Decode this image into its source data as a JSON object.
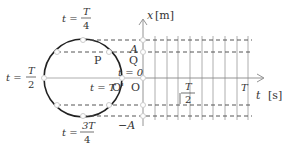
{
  "diagram": {
    "type": "circular-motion-to-simple-harmonic-oscillation",
    "colors": {
      "circle": "#222222",
      "axis": "#888888",
      "dashed": "#555555",
      "grid": "#999999",
      "marker_fill": "#ffffff",
      "marker_stroke": "#cccccc",
      "text": "#333333"
    },
    "axis_labels": {
      "x_axis": "x",
      "x_unit": "[m]",
      "t_axis": "t",
      "t_unit": "[s]"
    },
    "amplitude_labels": {
      "positive": "A",
      "negative": "−A"
    },
    "point_labels": {
      "P": "P",
      "Q": "Q",
      "O_prime": "O'",
      "O": "O"
    },
    "time_labels": {
      "t_eq": "t =",
      "t_zero": "t = 0",
      "t_T": "t = T",
      "quarter_num": "T",
      "quarter_den": "4",
      "half_num": "T",
      "half_den": "2",
      "threequarter_num": "3T",
      "threequarter_den": "4"
    },
    "t_axis_ticks": {
      "half_num": "T",
      "half_den": "2",
      "full": "T"
    },
    "grid_vertical_count": 9
  }
}
